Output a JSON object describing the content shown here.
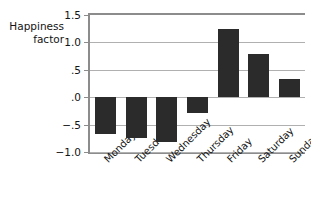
{
  "chart_data": {
    "type": "bar",
    "title": "",
    "subtitle": "",
    "xlabel": "",
    "ylabel": "Happiness\nfactor",
    "categories": [
      "Monday",
      "Tuesday",
      "Wednesday",
      "Thursday",
      "Friday",
      "Saturday",
      "Sunday"
    ],
    "values": [
      -0.68,
      -0.75,
      -0.82,
      -0.28,
      1.25,
      0.78,
      0.33
    ],
    "series": [
      {
        "name": "Happiness factor",
        "values": [
          -0.68,
          -0.75,
          -0.82,
          -0.28,
          1.25,
          0.78,
          0.33
        ]
      }
    ],
    "ylim": [
      -1.0,
      1.5
    ],
    "yticks": [
      1.5,
      1.0,
      0.5,
      0.0,
      -0.5,
      -1.0
    ],
    "ytick_labels": [
      "1.5",
      "1.0",
      ".5",
      ".0",
      "−.5",
      "−1.0"
    ],
    "grid": true,
    "grid_axis": "y",
    "legend": false,
    "legend_position": "none",
    "bar_color": "#2b2b2b",
    "grid_color": "#b0b0b0",
    "axis_color": "#8c8c8c",
    "xtick_label_rotation": -45,
    "baseline_value": 0.0
  }
}
